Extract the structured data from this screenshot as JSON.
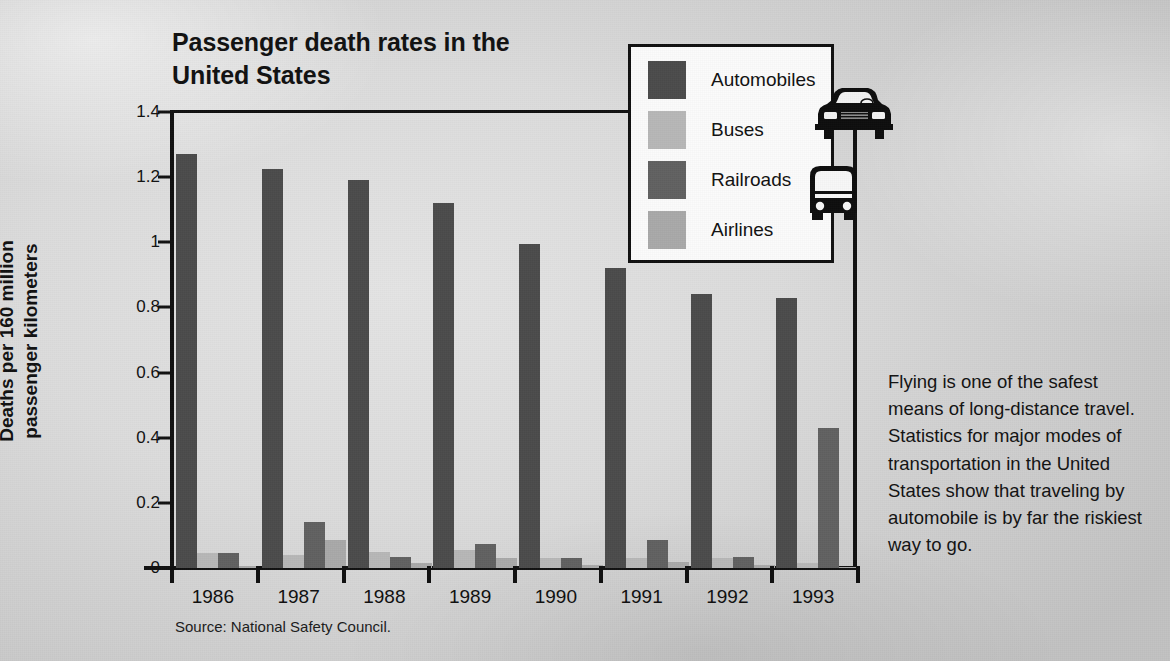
{
  "chart_data": {
    "type": "bar",
    "title": "Passenger death rates in the\nUnited States",
    "xlabel": "",
    "ylabel": "Deaths per 160 million\npassenger kilometers",
    "ylim": [
      0,
      1.4
    ],
    "yticks": [
      0,
      0.2,
      0.4,
      0.6,
      0.8,
      1,
      1.2,
      1.4
    ],
    "ytick_labels": [
      "0",
      "0.2",
      "0.4",
      "0.6",
      "0.8",
      "1",
      "1.2",
      "1.4"
    ],
    "grid": false,
    "legend_position": "top-right",
    "categories": [
      "1986",
      "1987",
      "1988",
      "1989",
      "1990",
      "1991",
      "1992",
      "1993"
    ],
    "series": [
      {
        "name": "Automobiles",
        "color": "#4b4b4b",
        "values": [
          1.27,
          1.225,
          1.19,
          1.12,
          0.995,
          0.92,
          0.84,
          0.83
        ]
      },
      {
        "name": "Buses",
        "color": "#b7b7b7",
        "values": [
          0.045,
          0.04,
          0.05,
          0.055,
          0.03,
          0.03,
          0.03,
          0.015
        ]
      },
      {
        "name": "Railroads",
        "color": "#616161",
        "values": [
          0.045,
          0.14,
          0.035,
          0.075,
          0.032,
          0.085,
          0.035,
          0.43
        ]
      },
      {
        "name": "Airlines",
        "color": "#a9a9a9",
        "values": [
          0.005,
          0.085,
          0.015,
          0.03,
          0.01,
          0.018,
          0.008,
          0.004
        ]
      }
    ],
    "source": "Source: National Safety Council."
  },
  "caption": {
    "text": "Flying is one of the safest means of long-distance travel. Statistics for major modes of transportation in the United States show that traveling by automobile is by far the riskiest way to go."
  },
  "icons": {
    "car": "car-front-icon",
    "bus": "bus-front-icon"
  }
}
